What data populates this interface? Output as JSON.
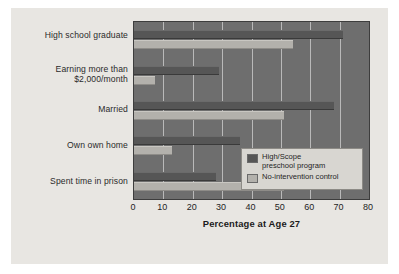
{
  "chart_data": {
    "type": "bar",
    "orientation": "horizontal",
    "title": "",
    "xlabel": "Percentage at Age 27",
    "ylabel": "",
    "xlim": [
      0,
      80
    ],
    "xticks": [
      0,
      10,
      20,
      30,
      40,
      50,
      60,
      70,
      80
    ],
    "xtick_labels": [
      "0",
      "10",
      "20",
      "30",
      "40",
      "50",
      "60",
      "70",
      "80"
    ],
    "grid": true,
    "grid_axis": "x",
    "legend_position": "inside-right-lower",
    "categories": [
      "High school graduate",
      "Earning more than $2,000/month",
      "Married",
      "Own own home",
      "Spent time in prison"
    ],
    "series": [
      {
        "name": "High/Scope preschool program",
        "color": "#565656",
        "values": [
          71,
          29,
          68,
          36,
          28
        ]
      },
      {
        "name": "No-intervention control",
        "color": "#b3b1ac",
        "values": [
          54,
          7,
          51,
          13,
          51
        ]
      }
    ]
  },
  "ycategories": [
    {
      "line1": "High school graduate",
      "line2": ""
    },
    {
      "line1": "Earning more than",
      "line2": "$2,000/month"
    },
    {
      "line1": "Married",
      "line2": ""
    },
    {
      "line1": "Own own home",
      "line2": ""
    },
    {
      "line1": "Spent time in prison",
      "line2": ""
    }
  ],
  "legend": {
    "items": [
      {
        "line1": "High/Scope",
        "line2": "preschool program",
        "swatch": "prog"
      },
      {
        "line1": "No-intervention control",
        "line2": "",
        "swatch": "ctrl"
      }
    ]
  },
  "axis": {
    "x_title": "Percentage at Age 27",
    "ticks": [
      "0",
      "10",
      "20",
      "30",
      "40",
      "50",
      "60",
      "70",
      "80"
    ]
  },
  "colors": {
    "program_bar": "#565656",
    "control_bar": "#b3b1ac",
    "plot_background": "#6e6e6e",
    "card_background": "#e8e6e2",
    "gridline": "#b9b9b9",
    "legend_background": "#d8d6d1"
  }
}
